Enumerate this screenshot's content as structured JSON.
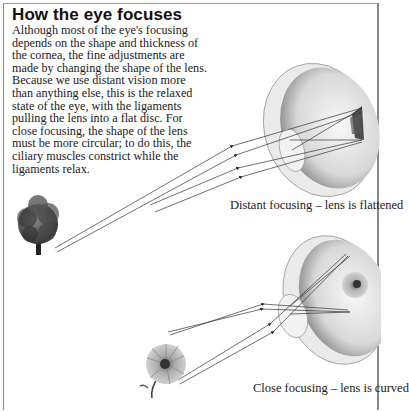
{
  "title": "How the eye focuses",
  "body": "Although most of the eye's focusing depends on the shape and thickness of the cornea, the fine adjustments are made by changing the shape of the lens. Because we use distant vision more than anything else, this is the relaxed state of the eye, with the ligaments pulling the lens into a flat disc. For close focusing, the shape of the lens must be more circular; to do this, the ciliary muscles constrict while the ligaments relax.",
  "figures": [
    {
      "id": "distant",
      "subject": "tree",
      "caption": "Distant focusing – lens is flattened"
    },
    {
      "id": "close",
      "subject": "flower",
      "caption": "Close focusing – lens is curved"
    }
  ]
}
